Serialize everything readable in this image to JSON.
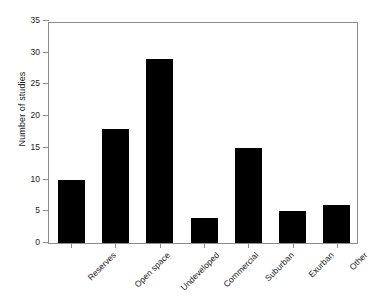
{
  "chart_data": {
    "type": "bar",
    "title": "",
    "xlabel": "",
    "ylabel": "Number of studies",
    "categories": [
      "Reserves",
      "Open space",
      "Undeveloped",
      "Commercial",
      "Suburban",
      "Exurban",
      "Other"
    ],
    "values": [
      10,
      18,
      29,
      4,
      15,
      5,
      6
    ],
    "ylim": [
      0,
      35
    ],
    "yticks": [
      0,
      5,
      10,
      15,
      20,
      25,
      30,
      35
    ],
    "ytick_labels": [
      "0",
      "5",
      "10",
      "15",
      "20",
      "25",
      "30",
      "35"
    ],
    "grid": false,
    "legend": null,
    "bar_color": "#000000",
    "axis_color": "#8c8c8c",
    "background": "#ffffff",
    "xlabel_rotation": -45
  }
}
